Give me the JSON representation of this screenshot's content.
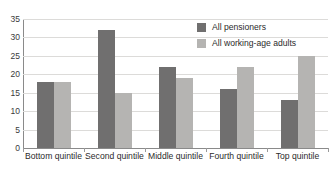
{
  "chart_data": {
    "type": "bar",
    "title": "",
    "subtitle": "",
    "xlabel": "",
    "ylabel": "",
    "ylim": [
      0,
      35
    ],
    "ytick_step": 5,
    "yticks": [
      0,
      5,
      10,
      15,
      20,
      25,
      30,
      35
    ],
    "ytick_labels": [
      "0",
      "5",
      "10",
      "15",
      "20",
      "25",
      "30",
      "35"
    ],
    "grid": true,
    "grid_axis": "y",
    "legend_position": "top-right-inside",
    "categories": [
      "Bottom quintile",
      "Second quintile",
      "Middle quintile",
      "Fourth quintile",
      "Top quintile"
    ],
    "series": [
      {
        "name": "All pensioners",
        "color": "#706f6f",
        "values": [
          18,
          32,
          22,
          16,
          13
        ]
      },
      {
        "name": "All working-age adults",
        "color": "#b5b4b2",
        "values": [
          18,
          15,
          19,
          22,
          25
        ]
      }
    ]
  },
  "colors": {
    "series_pensioners": "#706f6f",
    "series_working_age": "#b5b4b2",
    "gridline": "#dcdbd9",
    "axis": "#8a8a8a",
    "background": "#ffffff",
    "text": "#2b2b2b"
  }
}
